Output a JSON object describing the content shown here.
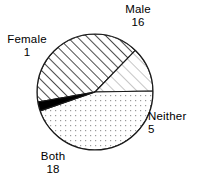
{
  "chart_data": {
    "type": "pie",
    "title": "",
    "total": 40,
    "categories": [
      "Male",
      "Female",
      "Both",
      "Neither"
    ],
    "values": [
      16,
      1,
      18,
      5
    ],
    "legend_position": "outside-labels",
    "grid": false,
    "series": [
      {
        "name": "counts",
        "values": [
          16,
          1,
          18,
          5
        ]
      }
    ],
    "slices": [
      {
        "label": "Male",
        "value": 16,
        "fill": "dense-black-diagonal-hatch",
        "start_angle": -100,
        "end_angle": 44,
        "sweep": 144
      },
      {
        "label": "Neither",
        "value": 5,
        "fill": "light-gray-diagonal-hatch",
        "start_angle": 44,
        "end_angle": 89,
        "sweep": 45
      },
      {
        "label": "Both",
        "value": 18,
        "fill": "light-gray-dot-grid",
        "start_angle": 89,
        "end_angle": 251,
        "sweep": 162
      },
      {
        "label": "Female",
        "value": 1,
        "fill": "solid-black",
        "start_angle": 251,
        "end_angle": 260,
        "sweep": 9
      }
    ],
    "geometry": {
      "cx": 95,
      "cy": 92,
      "r": 58
    },
    "colors": {
      "outline": "#1a1a1a",
      "female_fill": "#000000",
      "male_hatch": "#111111",
      "neither_hatch": "#8d8d8d",
      "both_dots": "#9a9a9a",
      "background": "#ffffff",
      "text": "#000000"
    }
  },
  "labels": {
    "male": {
      "name": "Male",
      "value": "16"
    },
    "female": {
      "name": "Female",
      "value": "1"
    },
    "neither": {
      "name": "Neither",
      "value": "5"
    },
    "both": {
      "name": "Both",
      "value": "18"
    }
  }
}
